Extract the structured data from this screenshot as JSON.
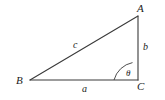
{
  "figure": {
    "kind": "geometry-diagram",
    "background_color": "#ffffff",
    "stroke_color": "#3a3a3a",
    "text_color": "#1b1b1b",
    "width": 165,
    "height": 100
  },
  "vertices": [
    {
      "id": "A",
      "label": "A",
      "x": 138,
      "y": 16
    },
    {
      "id": "B",
      "label": "B",
      "x": 30,
      "y": 80
    },
    {
      "id": "C",
      "label": "C",
      "x": 138,
      "y": 80
    }
  ],
  "sides": [
    {
      "id": "c",
      "label": "c",
      "from": "B",
      "to": "A",
      "role": "hypotenuse"
    },
    {
      "id": "b",
      "label": "b",
      "from": "A",
      "to": "C",
      "role": "opposite-leg"
    },
    {
      "id": "a",
      "label": "a",
      "from": "B",
      "to": "C",
      "role": "adjacent-leg"
    }
  ],
  "angle": {
    "label": "θ",
    "at_vertex": "C",
    "arc_radius": 24,
    "between": [
      "C-B",
      "C-A"
    ]
  }
}
